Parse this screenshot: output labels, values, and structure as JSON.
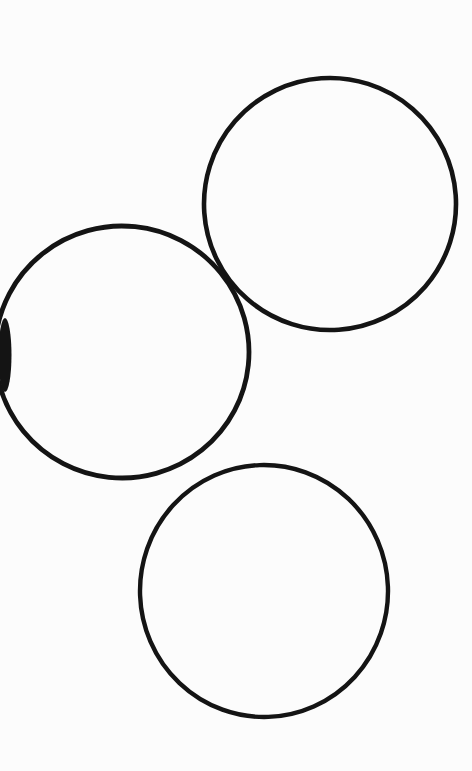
{
  "document": {
    "kind": "scanned-drawing",
    "title": "Three hand-drawn circles on white paper",
    "background_color": "#fdfdfd",
    "ink_color": "#141414",
    "width": 472,
    "height": 771,
    "shape_count": 3
  },
  "shapes": [
    {
      "id": "circle-top-right",
      "name": "Top-right circle",
      "type": "circle",
      "center_x": 330,
      "center_y": 204,
      "radius_x": 126,
      "radius_y": 126,
      "rotation": -4,
      "stroke_width": 4.6,
      "stroke_color": "#141414",
      "fill": "none"
    },
    {
      "id": "circle-middle-left",
      "name": "Middle-left circle",
      "type": "circle",
      "center_x": 122,
      "center_y": 352,
      "radius_x": 127,
      "radius_y": 126,
      "rotation": 6,
      "stroke_width": 4.8,
      "stroke_color": "#141414",
      "fill": "none",
      "clipped_edge": "left"
    },
    {
      "id": "circle-bottom",
      "name": "Bottom circle",
      "type": "circle",
      "center_x": 264,
      "center_y": 591,
      "radius_x": 124,
      "radius_y": 126,
      "rotation": -2,
      "stroke_width": 4.4,
      "stroke_color": "#141414",
      "fill": "none"
    }
  ],
  "artifacts": [
    {
      "id": "ink-blob-left-edge",
      "name": "Ink blob at left edge of middle-left circle",
      "type": "blob",
      "x": 0,
      "y": 318,
      "width": 10,
      "height": 74,
      "color": "#141414"
    }
  ],
  "intersections": [
    {
      "id": "crossing-upper",
      "name": "Crossing of middle-left and top-right circles",
      "x": 232,
      "y": 302
    }
  ]
}
